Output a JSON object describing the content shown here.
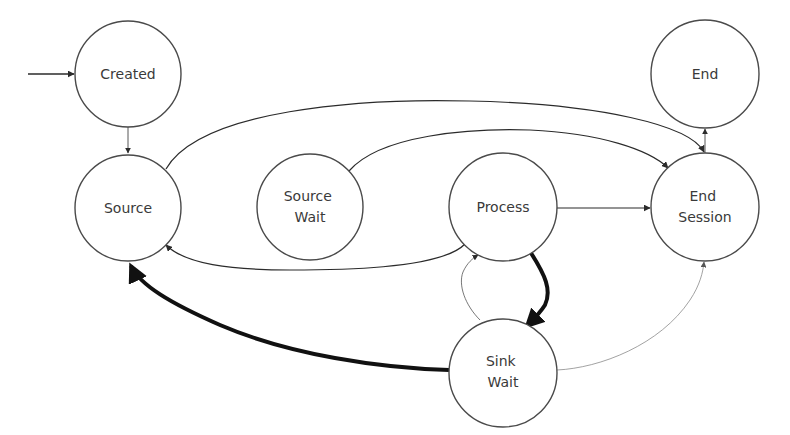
{
  "diagram": {
    "type": "state-machine",
    "initial_state": "created",
    "states": [
      {
        "id": "created",
        "label_lines": [
          "Created"
        ]
      },
      {
        "id": "source",
        "label_lines": [
          "Source"
        ]
      },
      {
        "id": "source_wait",
        "label_lines": [
          "Source",
          "Wait"
        ]
      },
      {
        "id": "process",
        "label_lines": [
          "Process"
        ]
      },
      {
        "id": "end_session",
        "label_lines": [
          "End",
          "Session"
        ]
      },
      {
        "id": "end",
        "label_lines": [
          "End"
        ]
      },
      {
        "id": "sink_wait",
        "label_lines": [
          "Sink",
          "Wait"
        ]
      }
    ],
    "transitions": [
      {
        "id": "init-to-created",
        "from": null,
        "to": "created",
        "weight": "normal"
      },
      {
        "id": "created-to-source",
        "from": "created",
        "to": "source",
        "weight": "thin"
      },
      {
        "id": "source-to-end-session",
        "from": "source",
        "to": "end_session",
        "weight": "normal"
      },
      {
        "id": "source-wait-to-end-session",
        "from": "source_wait",
        "to": "end_session",
        "weight": "normal"
      },
      {
        "id": "process-to-end-session",
        "from": "process",
        "to": "end_session",
        "weight": "normal"
      },
      {
        "id": "process-to-source",
        "from": "process",
        "to": "source",
        "weight": "normal"
      },
      {
        "id": "end-session-to-end",
        "from": "end_session",
        "to": "end",
        "weight": "thin"
      },
      {
        "id": "process-to-sink-wait",
        "from": "process",
        "to": "sink_wait",
        "weight": "heavy"
      },
      {
        "id": "sink-wait-to-process",
        "from": "sink_wait",
        "to": "process",
        "weight": "thin"
      },
      {
        "id": "sink-wait-to-source",
        "from": "sink_wait",
        "to": "source",
        "weight": "heavy"
      },
      {
        "id": "sink-wait-to-end-session",
        "from": "sink_wait",
        "to": "end_session",
        "weight": "hairline"
      }
    ],
    "colors": {
      "stroke": "#2b2b2b",
      "heavy": "#111111",
      "hairline": "#8a8a8a",
      "text": "#3a3a3a",
      "background": "#ffffff"
    }
  }
}
